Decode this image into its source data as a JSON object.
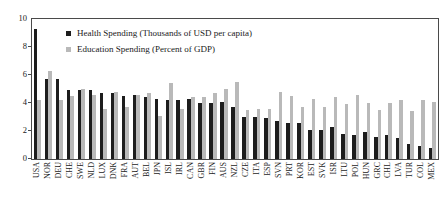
{
  "chart_data": {
    "type": "bar",
    "title": "",
    "subtitle": "",
    "xlabel": "",
    "ylabel": "",
    "ylim": [
      0,
      10
    ],
    "yticks": [
      0,
      2,
      4,
      6,
      8,
      10
    ],
    "grid": false,
    "legend_position": "top-left-inside",
    "categories": [
      "USA",
      "NOR",
      "DEU",
      "CHE",
      "SWE",
      "NLD",
      "LUX",
      "DNK",
      "FRA",
      "AUT",
      "BEL",
      "JPN",
      "ISL",
      "IRL",
      "CAN",
      "GBR",
      "FIN",
      "AUS",
      "NZL",
      "CZE",
      "ITA",
      "ESP",
      "SVN",
      "PRT",
      "KOR",
      "EST",
      "SVK",
      "ISR",
      "LTU",
      "POL",
      "HUN",
      "GRC",
      "CHL",
      "LVA",
      "TUR",
      "COL",
      "MEX"
    ],
    "series": [
      {
        "name": "Health Spending (Thousands of USD per capita)",
        "color": "#1d1d1d",
        "values": [
          9.3,
          5.7,
          5.7,
          4.9,
          4.9,
          4.9,
          4.7,
          4.7,
          4.5,
          4.6,
          4.4,
          4.3,
          4.2,
          4.2,
          4.3,
          4.0,
          4.0,
          4.1,
          3.7,
          3.0,
          3.0,
          2.9,
          2.7,
          2.6,
          2.6,
          2.1,
          2.1,
          2.3,
          1.8,
          1.7,
          1.9,
          1.6,
          1.7,
          1.5,
          1.1,
          0.9,
          0.8
        ]
      },
      {
        "name": "Education Spending (Percent of GDP)",
        "color": "#b9b9b9",
        "values": [
          4.2,
          6.3,
          4.2,
          4.5,
          5.0,
          4.6,
          3.6,
          4.8,
          3.7,
          4.6,
          4.7,
          3.1,
          5.4,
          3.6,
          4.4,
          4.4,
          4.7,
          5.0,
          5.5,
          3.5,
          3.6,
          3.6,
          4.8,
          4.5,
          3.7,
          4.3,
          3.7,
          4.4,
          3.9,
          4.6,
          4.0,
          3.5,
          4.0,
          4.2,
          3.4,
          4.2,
          4.1
        ]
      }
    ]
  },
  "legend": {
    "items": [
      {
        "marker": "square-dark",
        "label": "Health Spending (Thousands of USD per capita)"
      },
      {
        "marker": "square-gray",
        "label": "Education Spending (Percent of GDP)"
      }
    ]
  },
  "colors": {
    "health": "#1d1d1d",
    "education": "#b9b9b9",
    "axis": "#4a4a4a",
    "text": "#1a1a1a",
    "background": "#ffffff"
  }
}
